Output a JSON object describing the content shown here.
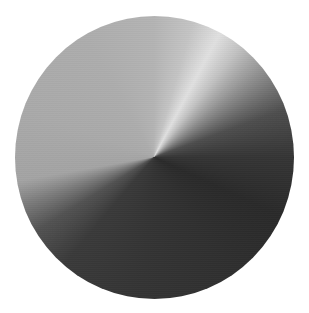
{
  "image": {
    "label": "Brushed metal conical gradient disc",
    "background_color": "#ffffff",
    "disc": {
      "center_px": [
        154,
        157
      ],
      "diameter_px": [
        279,
        283
      ],
      "gradient_type": "conic",
      "gradient_stops": [
        {
          "angle_deg": 0,
          "color": "#b4b4b4"
        },
        {
          "angle_deg": 16,
          "color": "#c4c4c4"
        },
        {
          "angle_deg": 28,
          "color": "#e0e0e0"
        },
        {
          "angle_deg": 38,
          "color": "#c2c2c2"
        },
        {
          "angle_deg": 52,
          "color": "#8e8e8e"
        },
        {
          "angle_deg": 70,
          "color": "#4e4e4e"
        },
        {
          "angle_deg": 90,
          "color": "#353535"
        },
        {
          "angle_deg": 115,
          "color": "#2a2a2a"
        },
        {
          "angle_deg": 150,
          "color": "#303030"
        },
        {
          "angle_deg": 185,
          "color": "#343434"
        },
        {
          "angle_deg": 220,
          "color": "#3a3a3a"
        },
        {
          "angle_deg": 238,
          "color": "#525252"
        },
        {
          "angle_deg": 250,
          "color": "#7c7c7c"
        },
        {
          "angle_deg": 260,
          "color": "#a4a4a4"
        },
        {
          "angle_deg": 290,
          "color": "#aaaaaa"
        },
        {
          "angle_deg": 330,
          "color": "#adadad"
        },
        {
          "angle_deg": 360,
          "color": "#b4b4b4"
        }
      ]
    }
  }
}
